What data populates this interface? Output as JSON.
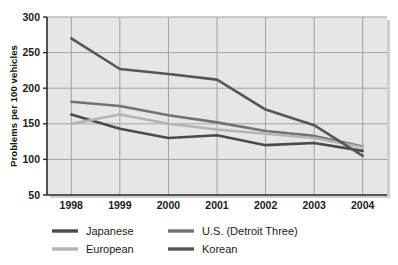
{
  "chart_data": {
    "type": "line",
    "title": "",
    "xlabel": "",
    "ylabel": "Problems per 100 vehicles",
    "categories": [
      "1998",
      "1999",
      "2000",
      "2001",
      "2002",
      "2003",
      "2004"
    ],
    "x": [
      1998,
      1999,
      2000,
      2001,
      2002,
      2003,
      2004
    ],
    "ylim": [
      50,
      300
    ],
    "yticks": [
      50,
      100,
      150,
      200,
      250,
      300
    ],
    "ytick_labels": [
      "50",
      "100",
      "150",
      "200",
      "250",
      "300"
    ],
    "grid": true,
    "legend_position": "bottom",
    "series": [
      {
        "name": "Japanese",
        "color": "#4a4a4a",
        "values": [
          163,
          143,
          130,
          134,
          120,
          123,
          112
        ]
      },
      {
        "name": "U.S. (Detroit Three)",
        "color": "#737373",
        "values": [
          181,
          175,
          162,
          152,
          140,
          133,
          118
        ]
      },
      {
        "name": "European",
        "color": "#b4b4b4",
        "values": [
          150,
          163,
          150,
          142,
          136,
          130,
          117
        ]
      },
      {
        "name": "Korean",
        "color": "#565656",
        "values": [
          270,
          227,
          220,
          212,
          170,
          148,
          105
        ]
      }
    ]
  },
  "legend": {
    "entries": [
      {
        "label": "Japanese",
        "color": "#4a4a4a"
      },
      {
        "label": "U.S. (Detroit Three)",
        "color": "#737373"
      },
      {
        "label": "European",
        "color": "#b4b4b4"
      },
      {
        "label": "Korean",
        "color": "#565656"
      }
    ]
  },
  "style": {
    "plot_background": "#e6e6e6",
    "grid_color": "#9a9a9a",
    "axis_color": "#2b2b2b",
    "page_background": "#ffffff"
  }
}
